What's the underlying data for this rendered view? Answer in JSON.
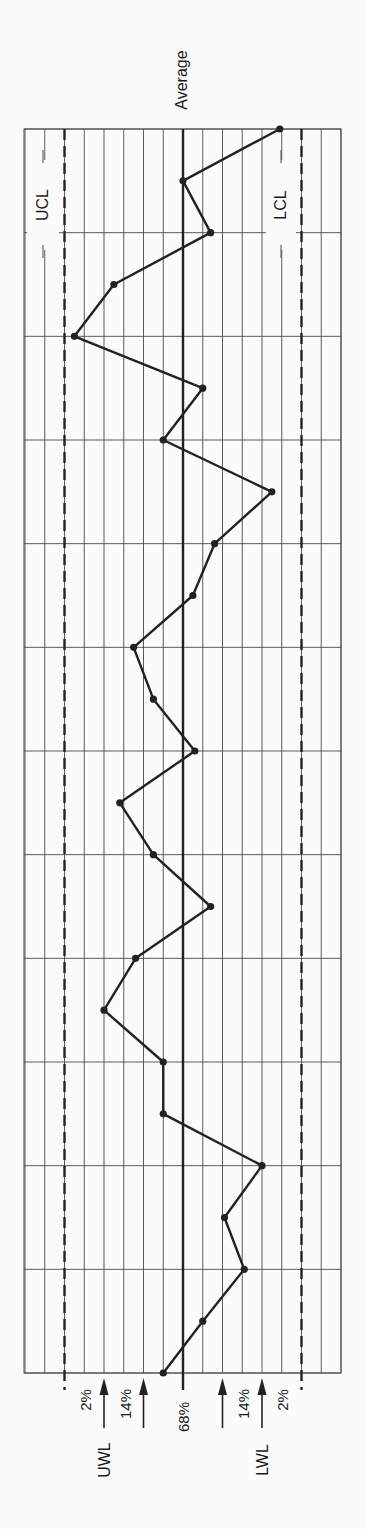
{
  "chart_data": {
    "type": "line",
    "title": "",
    "orientation": "rotated-90-ccw",
    "xlabel": "Sample",
    "ylabel": "Deviation from average (sigma)",
    "center_line_label": "Average",
    "limits": {
      "UCL": 3,
      "UWL": 2,
      "average": 0,
      "LWL": -2,
      "LCL": -3
    },
    "limit_labels": {
      "ucl": "UCL",
      "lcl": "LCL",
      "uwl": "UWL",
      "lwl": "LWL",
      "average": "Average"
    },
    "zone_labels": {
      "upper_outer": "2%",
      "upper_middle": "14%",
      "center": "68%",
      "lower_middle": "14%",
      "lower_outer": "2%"
    },
    "grid": true,
    "grid_columns_per_sigma": 2,
    "sigma_range": [
      -4,
      4
    ],
    "samples": 25,
    "x": [
      1,
      2,
      3,
      4,
      5,
      6,
      7,
      8,
      9,
      10,
      11,
      12,
      13,
      14,
      15,
      16,
      17,
      18,
      19,
      20,
      21,
      22,
      23,
      24,
      25
    ],
    "values": [
      0.5,
      -0.5,
      -1.55,
      -1.05,
      -2.0,
      0.5,
      0.5,
      2.0,
      1.2,
      -0.7,
      0.75,
      1.6,
      -0.3,
      0.75,
      1.25,
      -0.25,
      -0.8,
      -2.25,
      0.5,
      -0.5,
      2.75,
      1.75,
      -0.7,
      0.0,
      -2.45
    ]
  }
}
